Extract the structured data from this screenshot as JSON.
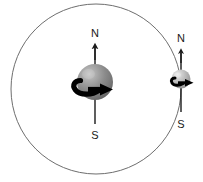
{
  "diagram": {
    "background_color": "#ffffff",
    "canvas": {
      "width": 203,
      "height": 182
    },
    "orbit": {
      "name": "orbit-circle",
      "center_x": 96,
      "center_y": 89,
      "radius": 85,
      "stroke_color": "#6e6e6e",
      "stroke_width": 1,
      "fill": "none"
    },
    "bodies": [
      {
        "id": "primary-body",
        "role": "planet",
        "center_x": 95,
        "center_y": 82,
        "radius": 18,
        "base_color": "#8a8a8a",
        "highlight_color": "#c9c9c9",
        "shadow_color": "#5a5a5a",
        "axis": {
          "name": "rotation-axis",
          "top_y": 45,
          "bottom_y": 124,
          "stroke_color": "#1a1a1a",
          "stroke_width": 1.4,
          "north_label": "N",
          "south_label": "S",
          "north_label_x": 95,
          "north_label_y": 33,
          "south_label_x": 95,
          "south_label_y": 135
        },
        "spin_arrow": {
          "name": "rotation-direction-arrow",
          "direction": "eastward",
          "color": "#000000",
          "stroke_width": 5
        }
      },
      {
        "id": "secondary-body",
        "role": "satellite",
        "center_x": 181,
        "center_y": 79,
        "radius": 9.5,
        "base_color": "#b5b5b5",
        "highlight_color": "#e0e0e0",
        "shadow_color": "#8c8c8c",
        "axis": {
          "name": "rotation-axis",
          "top_y": 50,
          "bottom_y": 112,
          "stroke_color": "#1a1a1a",
          "stroke_width": 1.4,
          "north_label": "N",
          "south_label": "S",
          "north_label_x": 181,
          "north_label_y": 38,
          "south_label_x": 181,
          "south_label_y": 124
        },
        "spin_arrow": {
          "name": "rotation-direction-arrow",
          "direction": "eastward",
          "color": "#000000",
          "stroke_width": 3
        }
      }
    ]
  }
}
